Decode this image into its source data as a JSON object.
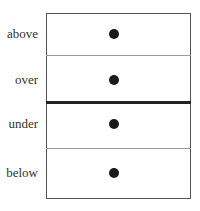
{
  "diagram": {
    "rows": [
      {
        "label": "above",
        "marker": "dot"
      },
      {
        "label": "over",
        "marker": "dot"
      },
      {
        "label": "under",
        "marker": "dot"
      },
      {
        "label": "below",
        "marker": "dot"
      }
    ],
    "dividers": [
      {
        "between": [
          "above",
          "over"
        ],
        "style": "thin"
      },
      {
        "between": [
          "over",
          "under"
        ],
        "style": "thick"
      },
      {
        "between": [
          "under",
          "below"
        ],
        "style": "thin"
      }
    ],
    "colors": {
      "border": "#555555",
      "thin_divider": "#999999",
      "thick_divider": "#222222",
      "dot": "#1a1a1a"
    }
  }
}
